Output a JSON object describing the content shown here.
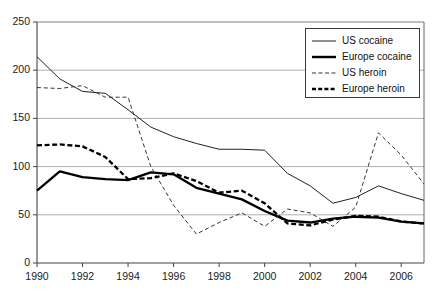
{
  "chart_data": {
    "type": "line",
    "title": "",
    "xlabel": "",
    "ylabel": "",
    "xlim": [
      1990,
      2007
    ],
    "ylim": [
      0,
      250
    ],
    "grid": true,
    "legend_position": "top-right",
    "x": [
      1990,
      1991,
      1992,
      1993,
      1994,
      1995,
      1996,
      1997,
      1998,
      1999,
      2000,
      2001,
      2002,
      2003,
      2004,
      2005,
      2006,
      2007
    ],
    "xticks": [
      1990,
      1992,
      1994,
      1996,
      1998,
      2000,
      2002,
      2004,
      2006
    ],
    "xtick_labels": [
      "1990",
      "1992",
      "1994",
      "1996",
      "1998",
      "2000",
      "2002",
      "2004",
      "2006"
    ],
    "yticks": [
      0,
      50,
      100,
      150,
      200,
      250
    ],
    "ytick_labels": [
      "0",
      "50",
      "100",
      "150",
      "200",
      "250"
    ],
    "series": [
      {
        "name": "US cocaine",
        "style": "solid",
        "width": "thin",
        "color": "#222222",
        "values": [
          214,
          191,
          178,
          176,
          159,
          141,
          131,
          124,
          118,
          118,
          117,
          93,
          80,
          62,
          68,
          80,
          72,
          65
        ]
      },
      {
        "name": "Europe cocaine",
        "style": "solid",
        "width": "thick",
        "color": "#000000",
        "values": [
          75,
          95,
          89,
          87,
          86,
          94,
          92,
          78,
          72,
          66,
          54,
          44,
          42,
          46,
          48,
          47,
          43,
          41
        ]
      },
      {
        "name": "US heroin",
        "style": "dashed",
        "width": "thin",
        "color": "#333333",
        "values": [
          182,
          181,
          184,
          172,
          172,
          100,
          60,
          30,
          42,
          52,
          38,
          56,
          52,
          38,
          58,
          135,
          112,
          82
        ]
      },
      {
        "name": "Europe heroin",
        "style": "dashed",
        "width": "thick",
        "color": "#000000",
        "values": [
          122,
          123,
          121,
          110,
          87,
          88,
          93,
          85,
          73,
          75,
          62,
          41,
          39,
          45,
          49,
          48,
          43,
          41
        ]
      }
    ]
  },
  "legend": {
    "entries": [
      {
        "label": "US cocaine"
      },
      {
        "label": "Europe cocaine"
      },
      {
        "label": "US heroin"
      },
      {
        "label": "Europe heroin"
      }
    ]
  }
}
